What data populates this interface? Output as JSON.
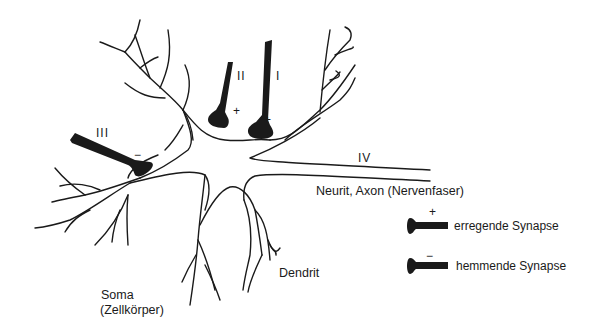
{
  "diagram": {
    "type": "neuron-schematic",
    "labels": {
      "soma": "Soma",
      "soma_sub": "(Zellkörper)",
      "dendrit": "Dendrit",
      "axon": "Neurit, Axon (Nervenfaser)"
    },
    "synapses": [
      {
        "id": "I",
        "sign": "+",
        "type": "erregend"
      },
      {
        "id": "II",
        "sign": "+",
        "type": "erregend"
      },
      {
        "id": "III",
        "sign": "−",
        "type": "hemmend"
      },
      {
        "id": "IV",
        "sign": "",
        "type": "axon"
      }
    ],
    "legend": [
      {
        "sign": "+",
        "label": "erregende Synapse"
      },
      {
        "sign": "−",
        "label": "hemmende Synapse"
      }
    ],
    "colors": {
      "ink": "#1a1a1a",
      "background": "#ffffff"
    }
  }
}
